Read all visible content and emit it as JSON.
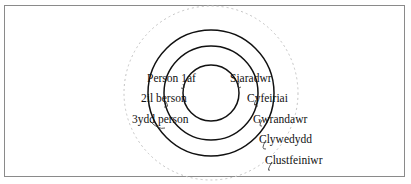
{
  "diagram": {
    "center": {
      "x": 211,
      "y": 93
    },
    "circles": [
      {
        "name": "inner",
        "r": 28,
        "style": "solid"
      },
      {
        "name": "second",
        "r": 47,
        "style": "solid"
      },
      {
        "name": "third",
        "r": 63,
        "style": "solid"
      },
      {
        "name": "outer",
        "r": 87,
        "style": "dashed"
      }
    ],
    "colors": {
      "stroke": "#111111",
      "dashed": "#bdbdbd",
      "frame": "#8a8a8a"
    },
    "labels_left": [
      {
        "text": "Person 1af",
        "x": 146,
        "y": 72
      },
      {
        "text": "2il berson",
        "x": 141,
        "y": 92
      },
      {
        "text": "3ydd person",
        "x": 132,
        "y": 113
      }
    ],
    "labels_right": [
      {
        "text": "Siaradwr",
        "x": 229,
        "y": 72
      },
      {
        "text": "Cyfeiriai",
        "x": 246,
        "y": 92
      },
      {
        "text": "Gwrandawr",
        "x": 252,
        "y": 113
      },
      {
        "text": "Clywedydd",
        "x": 259,
        "y": 132
      },
      {
        "text": "Clustfeiniwr",
        "x": 265,
        "y": 153
      }
    ]
  }
}
